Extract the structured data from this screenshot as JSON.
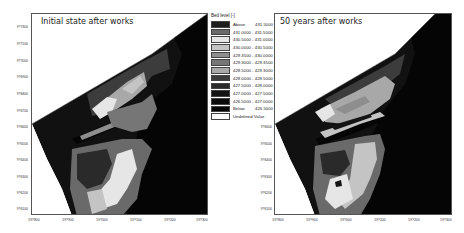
{
  "panels": [
    {
      "title": "Initial state after works",
      "y_ticks": [
        "9?7300",
        "9?7100",
        "9?7000",
        "9?6900",
        "9?6800",
        "9?6700",
        "9?6600",
        "9?6500",
        "9?6400",
        "9?6300",
        "9?6200",
        "9?6100"
      ],
      "x_ticks": [
        "59?800",
        "59?900",
        "59?000",
        "59?100",
        "59?200",
        "59?300"
      ]
    },
    {
      "title": "50 years after works",
      "y_ticks": [
        "9?6600",
        "9?6500",
        "9?6400",
        "9?6300",
        "9?6200",
        "9?6100"
      ],
      "x_ticks": [
        "59?800",
        "59?900",
        "59?000",
        "59?100",
        "59?200",
        "59?300"
      ]
    }
  ],
  "legend": {
    "title": "Bed level [-]",
    "items": [
      {
        "label": "Above",
        "value": "431.5000",
        "color": "#1e1e1e"
      },
      {
        "label": "431.0000 - 431.5000",
        "value": "",
        "color": "#6a6a6a"
      },
      {
        "label": "430.5000 - 431.0000",
        "value": "",
        "color": "#e6e6e6"
      },
      {
        "label": "430.0000 - 430.5000",
        "value": "",
        "color": "#c4c4c4"
      },
      {
        "label": "429.3500 - 430.0000",
        "value": "",
        "color": "#8e8e8e"
      },
      {
        "label": "429.3000 - 429.3500",
        "value": "",
        "color": "#767676"
      },
      {
        "label": "428.5000 - 429.3000",
        "value": "",
        "color": "#a8a8a8"
      },
      {
        "label": "428.0000 - 428.5000",
        "value": "",
        "color": "#3c3c3c"
      },
      {
        "label": "427.5000 - 428.0000",
        "value": "",
        "color": "#2a2a2a"
      },
      {
        "label": "427.0000 - 427.5000",
        "value": "",
        "color": "#141414"
      },
      {
        "label": "426.5000 - 427.0000",
        "value": "",
        "color": "#0a0a0a"
      },
      {
        "label": "Below",
        "value": "426.5000",
        "color": "#050505"
      },
      {
        "label": "Undefined Value",
        "value": "",
        "color": "#ffffff"
      }
    ]
  }
}
